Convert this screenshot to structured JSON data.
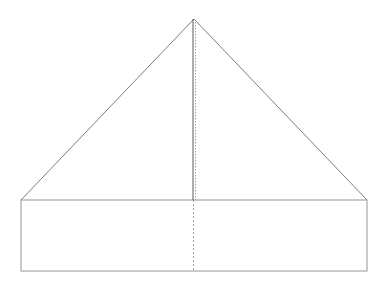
{
  "diagram": {
    "title": "",
    "stroke_color": "#6e6e6e",
    "spine_color": "#5a5a5a",
    "dash_color": "#8a8a8a",
    "apex": [
      194,
      19
    ],
    "base_left": [
      21,
      200
    ],
    "base_right": [
      367,
      200
    ],
    "rect": {
      "x": 21,
      "y": 200,
      "width": 346,
      "height": 71
    },
    "spine_x": 193,
    "spine_dotted_x": 195.5,
    "fold_line_x": 193.5
  }
}
